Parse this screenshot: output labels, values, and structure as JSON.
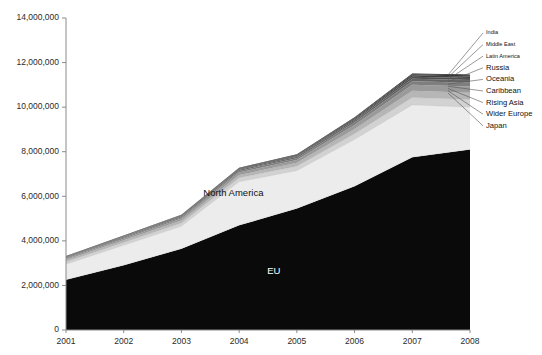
{
  "chart_data": {
    "type": "area",
    "stacked": true,
    "title": "",
    "subtitle": "",
    "xlabel": "",
    "ylabel": "",
    "grid": false,
    "legend_position": "right-callout",
    "x": [
      2001,
      2002,
      2003,
      2004,
      2005,
      2006,
      2007,
      2008
    ],
    "categories": [
      "2001",
      "2002",
      "2003",
      "2004",
      "2005",
      "2006",
      "2007",
      "2008"
    ],
    "xlim": [
      2001,
      2008
    ],
    "ylim": [
      0,
      14000000
    ],
    "ytick_values": [
      0,
      2000000,
      4000000,
      6000000,
      8000000,
      10000000,
      12000000,
      14000000
    ],
    "ytick_labels": [
      "0",
      "2,000,000",
      "4,000,000",
      "6,000,000",
      "8,000,000",
      "10,000,000",
      "12,000,000",
      "14,000,000"
    ],
    "series": [
      {
        "name": "EU",
        "color": "#0a0a0a",
        "values": [
          2250000,
          2900000,
          3650000,
          4700000,
          5450000,
          6450000,
          7750000,
          8100000
        ]
      },
      {
        "name": "North America",
        "color": "#ececec",
        "values": [
          700000,
          900000,
          1000000,
          1950000,
          1700000,
          2100000,
          2350000,
          1900000
        ]
      },
      {
        "name": "Japan",
        "color": "#d2d2d2",
        "values": [
          110000,
          130000,
          150000,
          180000,
          200000,
          260000,
          330000,
          340000
        ]
      },
      {
        "name": "Wider Europe",
        "color": "#b6b6b6",
        "values": [
          80000,
          95000,
          110000,
          130000,
          150000,
          210000,
          300000,
          310000
        ]
      },
      {
        "name": "Rising Asia",
        "color": "#9a9a9a",
        "values": [
          60000,
          75000,
          90000,
          110000,
          130000,
          180000,
          270000,
          280000
        ]
      },
      {
        "name": "Caribbean",
        "color": "#7e7e7e",
        "values": [
          40000,
          48000,
          58000,
          70000,
          82000,
          110000,
          160000,
          165000
        ]
      },
      {
        "name": "Oceania",
        "color": "#646464",
        "values": [
          30000,
          36000,
          43000,
          52000,
          60000,
          80000,
          115000,
          118000
        ]
      },
      {
        "name": "Russia",
        "color": "#4e4e4e",
        "values": [
          18000,
          22000,
          27000,
          33000,
          40000,
          55000,
          85000,
          90000
        ]
      },
      {
        "name": "Latin America",
        "color": "#3a3a3a",
        "values": [
          14000,
          17000,
          21000,
          26000,
          31000,
          43000,
          66000,
          70000
        ]
      },
      {
        "name": "Middle East",
        "color": "#282828",
        "values": [
          10000,
          12000,
          15000,
          19000,
          23000,
          32000,
          50000,
          54000
        ]
      },
      {
        "name": "India",
        "color": "#161616",
        "values": [
          7000,
          9000,
          11000,
          14000,
          17000,
          24000,
          38000,
          41000
        ]
      }
    ],
    "annotations": [
      {
        "text": "EU",
        "x": 2004.6,
        "y": 2500000,
        "on_dark": true
      },
      {
        "text": "North America",
        "x": 2003.9,
        "y": 6000000,
        "on_dark": false
      }
    ],
    "callout_legend": [
      {
        "label": "India"
      },
      {
        "label": "Middle East"
      },
      {
        "label": "Latin America"
      },
      {
        "label": "Russia"
      },
      {
        "label": "Oceania"
      },
      {
        "label": "Caribbean"
      },
      {
        "label": "Rising Asia"
      },
      {
        "label": "Wider Europe"
      },
      {
        "label": "Japan"
      }
    ]
  },
  "axes": {
    "axis_color": "#8a8a8a",
    "tick_font_size": 8.5
  }
}
